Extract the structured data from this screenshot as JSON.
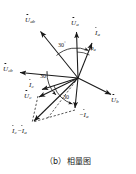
{
  "figure": {
    "caption": "（b）相量图",
    "type": "phasor-diagram",
    "stroke_color": "#1a1a1a",
    "background": "#ffffff",
    "origin": {
      "x": 78,
      "y": 78
    }
  },
  "labels": {
    "u_ab": {
      "text": "U",
      "sub": "ab",
      "overdot": true,
      "x": 27,
      "y": 20
    },
    "u_a": {
      "text": "U",
      "sub": "a",
      "overdot": true,
      "x": 72,
      "y": 22
    },
    "i_a": {
      "text": "I",
      "sub": "a",
      "overdot": true,
      "x": 95,
      "y": 32
    },
    "u_cb": {
      "text": "U",
      "sub": "cb",
      "overdot": true,
      "x": 4,
      "y": 71
    },
    "i_c": {
      "text": "I",
      "sub": "c",
      "overdot": true,
      "x": 31,
      "y": 84
    },
    "u_c": {
      "text": "U",
      "sub": "c",
      "overdot": true,
      "x": 26,
      "y": 95
    },
    "u_b": {
      "text": "U",
      "sub": "b",
      "overdot": true,
      "x": 112,
      "y": 99
    },
    "minus_i_a": {
      "text": "−I",
      "sub": "a",
      "overdot": true,
      "x": 76,
      "y": 114
    },
    "i_c_minus_i_a": {
      "text": "I",
      "sub": "c",
      "text2": "−I",
      "sub2": "a",
      "overdot": true,
      "x": 13,
      "y": 130
    }
  },
  "angles": {
    "upper_30": {
      "value": "30",
      "unit": "°",
      "x": 60,
      "y": 45
    },
    "left_30": {
      "value": "30",
      "unit": "°",
      "x": 41,
      "y": 76
    },
    "lower_30": {
      "value": "30",
      "unit": "",
      "x": 64,
      "y": 96
    },
    "phi_a": {
      "symbol": "φ",
      "sub": "a",
      "x": 91,
      "y": 47
    }
  },
  "vectors": [
    {
      "name": "U_ab",
      "from": [
        78,
        78
      ],
      "to": [
        38,
        29
      ],
      "style": "solid"
    },
    {
      "name": "U_a",
      "from": [
        78,
        78
      ],
      "to": [
        76,
        30
      ],
      "style": "solid"
    },
    {
      "name": "I_a",
      "from": [
        78,
        78
      ],
      "to": [
        93,
        41
      ],
      "style": "solid"
    },
    {
      "name": "U_cb",
      "from": [
        78,
        78
      ],
      "to": [
        18,
        72
      ],
      "style": "solid"
    },
    {
      "name": "I_c",
      "from": [
        78,
        78
      ],
      "to": [
        40,
        90
      ],
      "style": "solid"
    },
    {
      "name": "U_c",
      "from": [
        78,
        78
      ],
      "to": [
        37,
        98
      ],
      "style": "solid"
    },
    {
      "name": "U_b",
      "from": [
        78,
        78
      ],
      "to": [
        112,
        95
      ],
      "style": "solid"
    },
    {
      "name": "minus_I_a",
      "from": [
        78,
        78
      ],
      "to": [
        75,
        110
      ],
      "style": "solid"
    },
    {
      "name": "I_c_minus_I_a",
      "from": [
        78,
        78
      ],
      "to": [
        32,
        123
      ],
      "style": "solid"
    },
    {
      "name": "construction_U_c_to_sum",
      "from": [
        37,
        98
      ],
      "to": [
        32,
        123
      ],
      "style": "dashed"
    },
    {
      "name": "construction_minus_I_a_to_sum",
      "from": [
        75,
        110
      ],
      "to": [
        32,
        123
      ],
      "style": "dashed"
    },
    {
      "name": "construction_origin_down",
      "from": [
        78,
        78
      ],
      "to": [
        46,
        120
      ],
      "style": "dashed"
    }
  ]
}
